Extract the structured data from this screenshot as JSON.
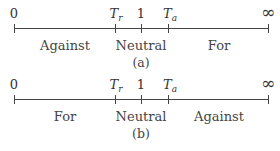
{
  "diagrams": [
    {
      "caption": "(a)",
      "ticks": [
        {
          "label": "0",
          "x": 14
        },
        {
          "label_main": "T",
          "label_sub": "r",
          "x": 115
        },
        {
          "label": "1",
          "x": 141
        },
        {
          "label_main": "T",
          "label_sub": "a",
          "x": 168
        },
        {
          "label": "∞",
          "x": 269
        }
      ],
      "regions": [
        {
          "label": "Against",
          "x": 65
        },
        {
          "label": "Neutral",
          "x": 141
        },
        {
          "label": "For",
          "x": 219
        }
      ]
    },
    {
      "caption": "(b)",
      "ticks": [
        {
          "label": "0",
          "x": 14
        },
        {
          "label_main": "T",
          "label_sub": "r",
          "x": 115
        },
        {
          "label": "1",
          "x": 141
        },
        {
          "label_main": "T",
          "label_sub": "a",
          "x": 168
        },
        {
          "label": "∞",
          "x": 269
        }
      ],
      "regions": [
        {
          "label": "For",
          "x": 65
        },
        {
          "label": "Neutral",
          "x": 141
        },
        {
          "label": "Against",
          "x": 219
        }
      ]
    }
  ]
}
